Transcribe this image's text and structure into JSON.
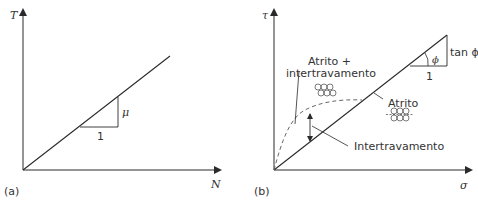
{
  "panel_a": {
    "tag": "(a)",
    "y_axis_label": "T",
    "x_axis_label": "N",
    "slope_label": "μ",
    "run_label": "1"
  },
  "panel_b": {
    "tag": "(b)",
    "y_axis_label": "τ",
    "x_axis_label": "σ",
    "angle_label": "ϕ",
    "slope_label": "tan ϕ",
    "run_label": "1",
    "label_combined_line1": "Atrito +",
    "label_combined_line2": "intertravamento",
    "label_friction": "Atrito",
    "label_interlock": "Intertravamento"
  },
  "colors": {
    "line": "#2a2a2a",
    "text": "#333333",
    "dashed": "#666666"
  }
}
